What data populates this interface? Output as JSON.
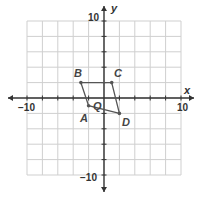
{
  "chart_data": {
    "type": "coordinate-plane",
    "title": "",
    "xlabel": "x",
    "ylabel": "y",
    "xlim": [
      -10,
      10
    ],
    "ylim": [
      -10,
      10
    ],
    "grid": true,
    "grid_step": 2,
    "tick_labels": {
      "x_min": "−10",
      "x_max": "10",
      "y_min": "−10",
      "y_max": "10"
    },
    "polygon": {
      "vertices": [
        {
          "name": "A",
          "x": -2,
          "y": -1
        },
        {
          "name": "B",
          "x": -3,
          "y": 2
        },
        {
          "name": "C",
          "x": 1,
          "y": 2
        },
        {
          "name": "D",
          "x": 2,
          "y": -2
        }
      ],
      "order": [
        "A",
        "B",
        "C",
        "D"
      ]
    },
    "annotations": [
      {
        "text": "Q",
        "x": -1,
        "y": -1
      }
    ]
  },
  "labels": {
    "x_axis": "x",
    "y_axis": "y",
    "x_min": "−10",
    "x_max": "10",
    "y_min": "−10",
    "y_max": "10",
    "A": "A",
    "B": "B",
    "C": "C",
    "D": "D",
    "Q": "Q"
  },
  "colors": {
    "grid": "#cfcfcf",
    "axis": "#333333",
    "polygon": "#555555"
  }
}
